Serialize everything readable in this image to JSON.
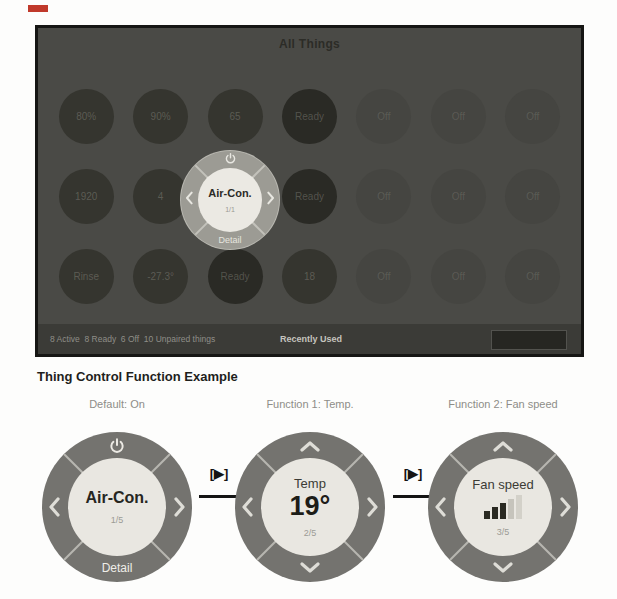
{
  "screenshot": {
    "title": "All Things",
    "things": [
      "80%",
      "90%",
      "65",
      "Ready",
      "Off",
      "Off",
      "Off",
      "1920",
      "4",
      "",
      "Ready",
      "Off",
      "Off",
      "Off",
      "Rinse",
      "-27.3°",
      "Ready",
      "18",
      "Off",
      "Off",
      "Off"
    ],
    "dial": {
      "title": "Air-Con.",
      "page": "1/1",
      "detail": "Detail"
    },
    "status": {
      "summary": "8 Active  8 Ready  6 Off  10 Unpaired things",
      "recently_used": "Recently Used",
      "button_label": ""
    }
  },
  "example": {
    "heading": "Thing Control Function Example",
    "transition_label": "[▶]",
    "dials": [
      {
        "caption": "Default: On",
        "title": "Air-Con.",
        "page": "1/5",
        "detail": "Detail"
      },
      {
        "caption": "Function 1: Temp.",
        "title": "Temp",
        "value": "19°",
        "page": "2/5"
      },
      {
        "caption": "Function 2: Fan speed",
        "title": "Fan speed",
        "page": "3/5"
      }
    ]
  },
  "colors": {
    "panel_bg": "#4a4a46",
    "dial_ring": "#74736f",
    "dial_inner": "#e9e7e1",
    "red_mark": "#c0392b"
  }
}
